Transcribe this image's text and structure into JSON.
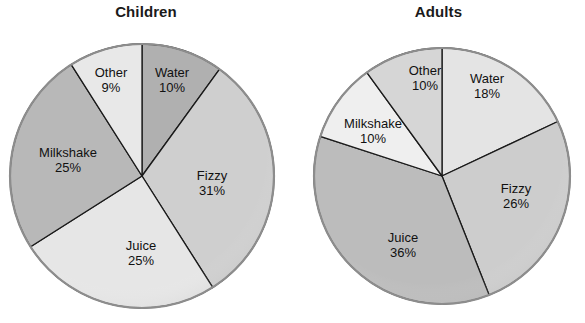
{
  "chart_data": [
    {
      "type": "pie",
      "title": "Children",
      "categories": [
        "Water",
        "Fizzy",
        "Juice",
        "Milkshake",
        "Other"
      ],
      "values": [
        10,
        31,
        25,
        25,
        9
      ],
      "labels": [
        "10%",
        "31%",
        "25%",
        "25%",
        "9%"
      ],
      "units": "percent",
      "start_angle_deg": 0,
      "direction": "clockwise",
      "legend": "none",
      "grid": false,
      "slice_colors": [
        "#b0b0b0",
        "#cfcfcf",
        "#e6e6e6",
        "#b8b8b8",
        "#e8e8e8"
      ],
      "edge_color": "#1a1a1a",
      "outline_color": "#8d8d8d",
      "geometry": {
        "cx": 142,
        "cy": 176,
        "r": 132
      },
      "label_positions": [
        {
          "x": 172,
          "y": 80
        },
        {
          "x": 212,
          "y": 183
        },
        {
          "x": 141,
          "y": 253
        },
        {
          "x": 68,
          "y": 160
        },
        {
          "x": 111,
          "y": 80
        }
      ]
    },
    {
      "type": "pie",
      "title": "Adults",
      "categories": [
        "Water",
        "Fizzy",
        "Juice",
        "Milkshake",
        "Other"
      ],
      "values": [
        18,
        26,
        36,
        10,
        10
      ],
      "labels": [
        "18%",
        "26%",
        "36%",
        "10%",
        "10%"
      ],
      "units": "percent",
      "start_angle_deg": 0,
      "direction": "clockwise",
      "legend": "none",
      "grid": false,
      "slice_colors": [
        "#e4e4e4",
        "#cdcdcd",
        "#bcbcbc",
        "#efefef",
        "#d6d6d6"
      ],
      "edge_color": "#1a1a1a",
      "outline_color": "#8d8d8d",
      "geometry": {
        "cx": 442,
        "cy": 176,
        "r": 128
      },
      "label_positions": [
        {
          "x": 487,
          "y": 86
        },
        {
          "x": 516,
          "y": 196
        },
        {
          "x": 403,
          "y": 245
        },
        {
          "x": 373,
          "y": 131
        },
        {
          "x": 425,
          "y": 78
        }
      ]
    }
  ],
  "children_chart": {
    "title": "Children",
    "slices": [
      {
        "name": "Water",
        "pct": "10%"
      },
      {
        "name": "Fizzy",
        "pct": "31%"
      },
      {
        "name": "Juice",
        "pct": "25%"
      },
      {
        "name": "Milkshake",
        "pct": "25%"
      },
      {
        "name": "Other",
        "pct": "9%"
      }
    ]
  },
  "adults_chart": {
    "title": "Adults",
    "slices": [
      {
        "name": "Water",
        "pct": "18%"
      },
      {
        "name": "Fizzy",
        "pct": "26%"
      },
      {
        "name": "Juice",
        "pct": "36%"
      },
      {
        "name": "Milkshake",
        "pct": "10%"
      },
      {
        "name": "Other",
        "pct": "10%"
      }
    ]
  }
}
